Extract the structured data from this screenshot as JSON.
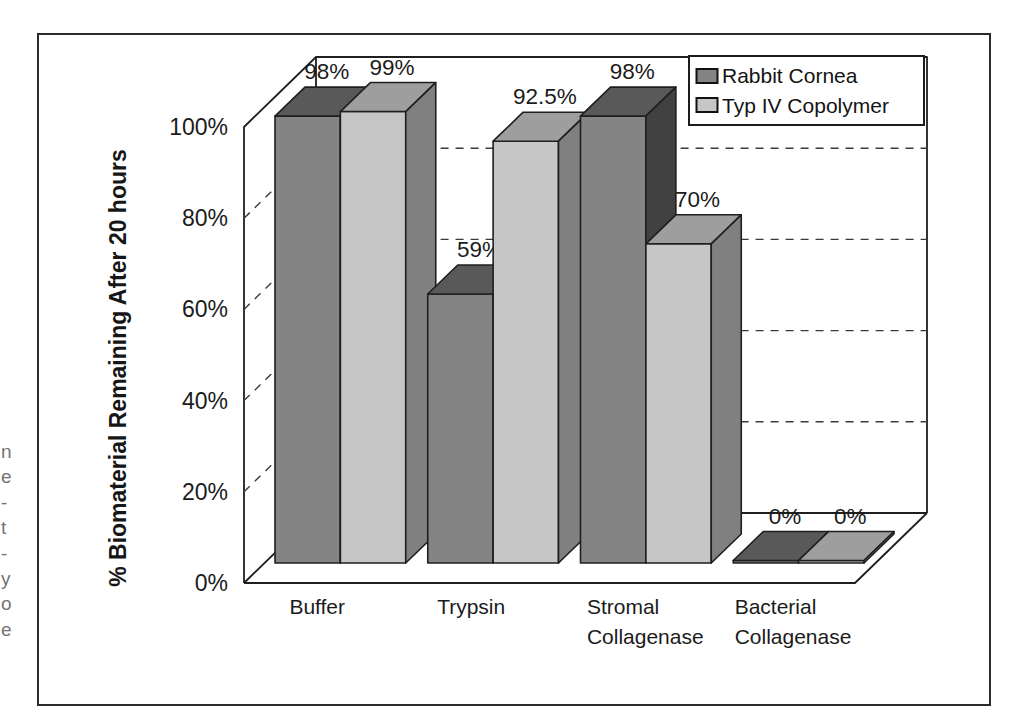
{
  "page": {
    "background": "#ffffff"
  },
  "edge_fragments": [
    "n",
    "e",
    "-",
    "t",
    "-",
    "y",
    "o",
    "e"
  ],
  "figure": {
    "border_color": "#2b2b2b",
    "background": "#ffffff"
  },
  "chart_data": {
    "type": "bar",
    "projection": "3d",
    "title": "",
    "ylabel": "% Biomaterial Remaining After 20 hours",
    "xlabel": "",
    "ylim": [
      0,
      100
    ],
    "yticks": [
      {
        "value": 0,
        "label": "0%"
      },
      {
        "value": 20,
        "label": "20%"
      },
      {
        "value": 40,
        "label": "40%"
      },
      {
        "value": 60,
        "label": "60%"
      },
      {
        "value": 80,
        "label": "80%"
      },
      {
        "value": 100,
        "label": "100%"
      }
    ],
    "grid": "dashed-horizontal",
    "legend_position": "top-right",
    "categories": [
      "Buffer",
      "Trypsin",
      "Stromal Collagenase",
      "Bacterial Collagenase"
    ],
    "category_label_lines": [
      [
        "Buffer"
      ],
      [
        "Trypsin"
      ],
      [
        "Stromal",
        "Collagenase"
      ],
      [
        "Bacterial",
        "Collagenase"
      ]
    ],
    "series": [
      {
        "name": "Rabbit Cornea",
        "values": [
          98,
          59,
          98,
          0
        ],
        "value_labels": [
          "98%",
          "59%",
          "98%",
          "0%"
        ],
        "colors": {
          "front": "#848484",
          "top": "#595959",
          "side": "#414141"
        }
      },
      {
        "name": "Typ IV Copolymer",
        "values": [
          99,
          92.5,
          70,
          0
        ],
        "value_labels": [
          "99%",
          "92.5%",
          "70%",
          "0%"
        ],
        "colors": {
          "front": "#c6c6c6",
          "top": "#9e9e9e",
          "side": "#808080"
        }
      }
    ],
    "line_color": "#1f1f1f",
    "text_color": "#1b1b1b"
  }
}
